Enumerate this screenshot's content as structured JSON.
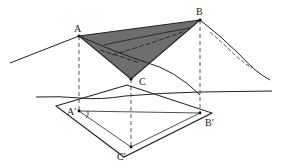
{
  "diagram": {
    "type": "geometry-projection",
    "colors": {
      "line": "#222222",
      "shade": "#6e6e6e",
      "background": "#ffffff"
    },
    "labels": {
      "A": "A",
      "B": "B",
      "C": "C",
      "A_prime": "A′",
      "B_prime": "B′",
      "C_prime": "C′"
    },
    "points": {
      "A": [
        79,
        36
      ],
      "B": [
        200,
        20
      ],
      "C": [
        131,
        79
      ],
      "A_prime": [
        79,
        111
      ],
      "B_prime": [
        200,
        113
      ],
      "C_prime": [
        131,
        147
      ]
    }
  }
}
